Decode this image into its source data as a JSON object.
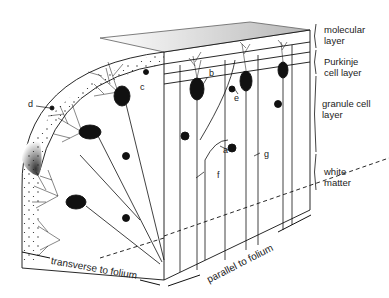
{
  "figure": {
    "layers": [
      {
        "id": "molecular",
        "label": "molecular layer"
      },
      {
        "id": "purkinje",
        "label": "Purkinje cell layer"
      },
      {
        "id": "granule",
        "label": "granule cell layer"
      },
      {
        "id": "white",
        "label": "white matter"
      }
    ],
    "layer_labels": {
      "molecular_1": "molecular",
      "molecular_2": "layer",
      "purkinje_1": "Purkinje",
      "purkinje_2": "cell layer",
      "granule_1": "granule cell",
      "granule_2": "layer",
      "white_1": "white",
      "white_2": "matter"
    },
    "letters": {
      "a": "a",
      "b": "b",
      "c": "c",
      "d": "d",
      "e": "e",
      "f": "f",
      "g": "g"
    },
    "axes": {
      "transverse": "transverse to  folium",
      "parallel": "parallel to  folium"
    },
    "colors": {
      "ink": "#111111",
      "background": "#ffffff"
    }
  }
}
